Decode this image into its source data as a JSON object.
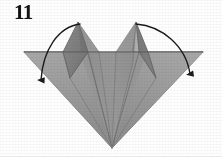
{
  "figure": {
    "kind": "origami-fold-diagram",
    "step_number": "11",
    "background_color": "#fefefe",
    "canvas": {
      "width": 222,
      "height": 157
    }
  },
  "palette": {
    "paper_light": "#b3b3b3",
    "paper_mid": "#9a9a9a",
    "paper_dark": "#828282",
    "paper_darker": "#767676",
    "paper_shadow": "#6e6e6e",
    "edge_line": "#5c5c5c",
    "crease_line": "#6b6b6b",
    "arrow_color": "#1a1a1a",
    "number_color": "#131313"
  },
  "geometry": {
    "top_edge_y": 52,
    "left_corner_x": 24,
    "right_corner_x": 203,
    "bottom_tip": {
      "x": 112,
      "y": 148
    },
    "left_spike_tip": {
      "x": 78,
      "y": 22
    },
    "right_spike_tip": {
      "x": 136,
      "y": 22
    }
  },
  "annotations": {
    "arrows": [
      {
        "name": "left-fold-arrow",
        "direction": "down-left",
        "start": {
          "x": 79,
          "y": 24
        },
        "end": {
          "x": 41,
          "y": 86
        },
        "head": "solid-triangle"
      },
      {
        "name": "right-fold-arrow",
        "direction": "down-right",
        "start": {
          "x": 137,
          "y": 24
        },
        "end": {
          "x": 190,
          "y": 80
        },
        "head": "solid-triangle"
      }
    ]
  },
  "labels": {
    "step_caption": "11"
  }
}
